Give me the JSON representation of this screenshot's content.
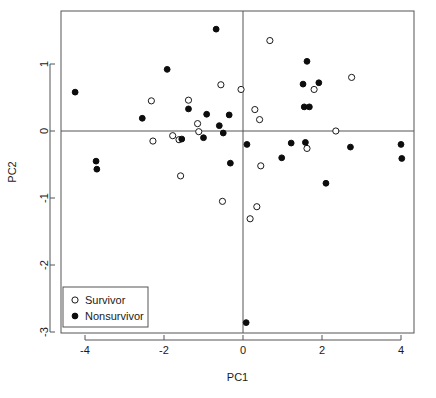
{
  "chart_data": {
    "type": "scatter",
    "title": "",
    "xlabel": "PC1",
    "ylabel": "PC2",
    "xlim": [
      -4.85,
      4.55
    ],
    "ylim": [
      -3.05,
      1.75
    ],
    "xticks": [
      "-4",
      "-2",
      "0",
      "2",
      "4"
    ],
    "xtick_values": [
      -4,
      -2,
      0,
      2,
      4
    ],
    "yticks": [
      "1",
      "0",
      "-1",
      "-2",
      "-3"
    ],
    "ytick_values": [
      1,
      0,
      -1,
      -2,
      -3
    ],
    "grid": false,
    "reference_lines": {
      "vertical_x": 0,
      "horizontal_y": 0
    },
    "legend": {
      "position": "bottom-left",
      "entries": [
        {
          "label": "Survivor",
          "marker": "open-circle"
        },
        {
          "label": "Nonsurvivor",
          "marker": "filled-circle"
        }
      ]
    },
    "series": [
      {
        "name": "Survivor",
        "marker": "open-circle",
        "points": [
          [
            -2.32,
            0.45
          ],
          [
            -2.28,
            -0.15
          ],
          [
            -1.78,
            -0.07
          ],
          [
            -1.62,
            -0.13
          ],
          [
            -1.58,
            -0.67
          ],
          [
            -1.38,
            0.46
          ],
          [
            -1.15,
            0.11
          ],
          [
            -1.12,
            -0.01
          ],
          [
            -0.56,
            0.69
          ],
          [
            -0.52,
            -1.05
          ],
          [
            -0.05,
            0.62
          ],
          [
            0.18,
            -1.31
          ],
          [
            0.3,
            0.32
          ],
          [
            0.35,
            -1.13
          ],
          [
            0.42,
            0.17
          ],
          [
            0.45,
            -0.52
          ],
          [
            0.68,
            1.35
          ],
          [
            1.62,
            -0.26
          ],
          [
            1.8,
            0.62
          ],
          [
            2.35,
            0.0
          ],
          [
            2.75,
            0.8
          ]
        ]
      },
      {
        "name": "Nonsurvivor",
        "marker": "filled-circle",
        "points": [
          [
            -4.25,
            0.58
          ],
          [
            -3.72,
            -0.45
          ],
          [
            -3.7,
            -0.57
          ],
          [
            -2.55,
            0.19
          ],
          [
            -1.92,
            0.92
          ],
          [
            -1.55,
            -0.12
          ],
          [
            -1.38,
            0.33
          ],
          [
            -1.0,
            -0.1
          ],
          [
            -0.92,
            0.25
          ],
          [
            -0.68,
            1.52
          ],
          [
            -0.6,
            0.08
          ],
          [
            -0.5,
            -0.03
          ],
          [
            -0.35,
            0.24
          ],
          [
            -0.32,
            -0.48
          ],
          [
            0.08,
            -2.86
          ],
          [
            0.1,
            -0.2
          ],
          [
            0.98,
            -0.4
          ],
          [
            1.22,
            -0.18
          ],
          [
            1.52,
            0.7
          ],
          [
            1.55,
            0.36
          ],
          [
            1.58,
            -0.17
          ],
          [
            1.62,
            1.04
          ],
          [
            1.68,
            0.36
          ],
          [
            1.92,
            0.72
          ],
          [
            2.1,
            -0.78
          ],
          [
            2.72,
            -0.24
          ],
          [
            4.0,
            -0.2
          ],
          [
            4.02,
            -0.41
          ]
        ]
      }
    ]
  },
  "plot_geometry": {
    "left": 61,
    "top": 11,
    "right": 414,
    "bottom": 333,
    "x_origin_px": 243,
    "y_origin_px": 131,
    "px_per_x_unit": 39.5,
    "px_per_y_unit": 67
  },
  "legend_geometry": {
    "x": 63,
    "y": 287,
    "width": 85,
    "height": 40
  },
  "colors": {
    "background": "#ffffff",
    "axis": "#555555",
    "text": "#1a1a1a",
    "marker_fill": "#0d0d0d",
    "marker_open": "#ffffff"
  }
}
